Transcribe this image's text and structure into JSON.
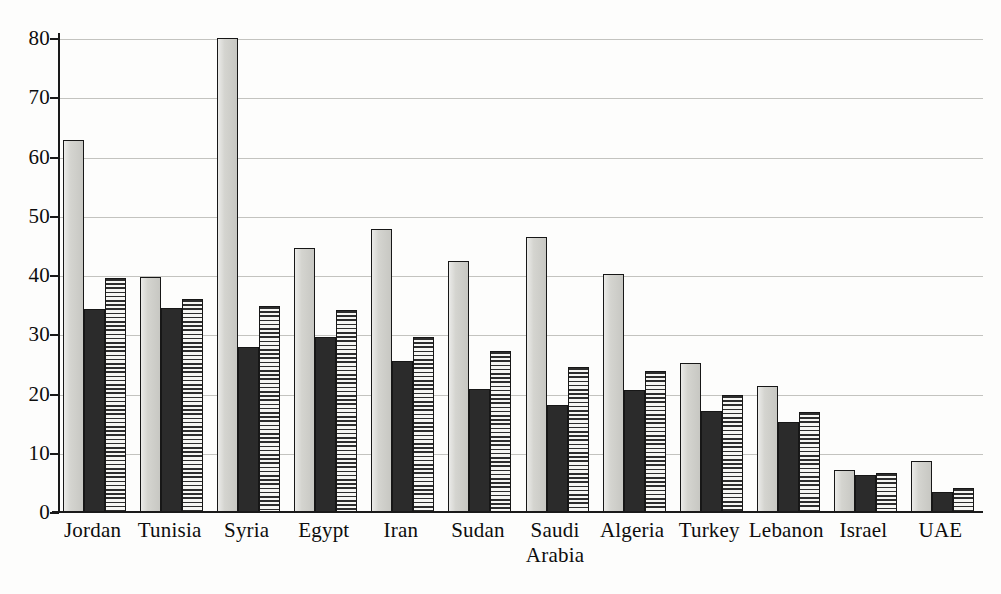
{
  "chart_data": {
    "type": "bar",
    "title": "",
    "subtitle": "",
    "xlabel": "",
    "ylabel": "",
    "ylim": [
      0,
      80
    ],
    "ytick_step": 10,
    "ytick_labels": [
      "0",
      "10",
      "20",
      "30",
      "40",
      "50",
      "60",
      "70",
      "80"
    ],
    "grid": true,
    "legend": null,
    "legend_position": "none",
    "categories": [
      "Jordan",
      "Tunisia",
      "Syria",
      "Egypt",
      "Iran",
      "Sudan",
      "Saudi\nArabia",
      "Algeria",
      "Turkey",
      "Lebanon",
      "Israel",
      "UAE"
    ],
    "series": [
      {
        "name": "series-1",
        "style": "light-gray-solid",
        "color": "#d2d2cd",
        "values": [
          62.9,
          39.9,
          80.2,
          44.8,
          47.9,
          42.6,
          46.6,
          40.4,
          25.3,
          21.5,
          7.2,
          8.8
        ]
      },
      {
        "name": "series-2",
        "style": "black-solid",
        "color": "#2b2b2b",
        "values": [
          34.4,
          34.6,
          28.1,
          29.7,
          25.6,
          21.0,
          18.3,
          20.8,
          17.2,
          15.3,
          6.5,
          3.6
        ]
      },
      {
        "name": "series-3",
        "style": "horizontal-hatch",
        "color": "#f4f4f1",
        "values": [
          39.7,
          36.1,
          35.0,
          34.2,
          29.7,
          27.3,
          24.7,
          24.0,
          19.9,
          17.1,
          6.8,
          4.3
        ]
      }
    ]
  },
  "axes": {
    "y_axis_color": "#1a1a1a",
    "x_axis_color": "#1a1a1a",
    "gridline_color": "#b9b9b4"
  }
}
